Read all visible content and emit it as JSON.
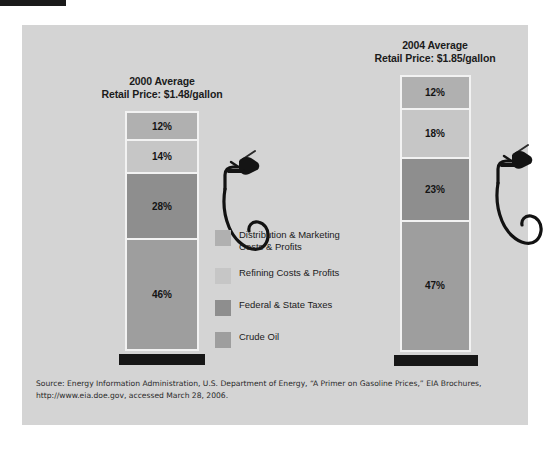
{
  "figure": {
    "source_line1": "Source: Energy Information Administration, U.S. Department of Energy, “A Primer on Gasoline Prices,” EIA Brochures,",
    "source_line2": "http://www.eia.doe.gov, accessed March 28, 2006."
  },
  "legend": {
    "items": [
      {
        "label": "Distribution & Marketing\nCosts & Profits",
        "color": "#b0b0b0"
      },
      {
        "label": "Refining Costs & Profits",
        "color": "#c6c6c6"
      },
      {
        "label": "Federal & State Taxes",
        "color": "#8e8e8e"
      },
      {
        "label": "Crude Oil",
        "color": "#9e9e9e"
      }
    ]
  },
  "charts": [
    {
      "id": "chart-2000",
      "title_line1": "2000 Average",
      "title_line2": "Retail Price: $1.48/gallon",
      "segments": [
        {
          "label": "12%",
          "value": 12,
          "name": "Distribution & Marketing Costs & Profits",
          "color": "#b0b0b0"
        },
        {
          "label": "14%",
          "value": 14,
          "name": "Refining Costs & Profits",
          "color": "#c6c6c6"
        },
        {
          "label": "28%",
          "value": 28,
          "name": "Federal & State Taxes",
          "color": "#8e8e8e"
        },
        {
          "label": "46%",
          "value": 46,
          "name": "Crude Oil",
          "color": "#9e9e9e"
        }
      ]
    },
    {
      "id": "chart-2004",
      "title_line1": "2004 Average",
      "title_line2": "Retail Price: $1.85/gallon",
      "segments": [
        {
          "label": "12%",
          "value": 12,
          "name": "Distribution & Marketing Costs & Profits",
          "color": "#b0b0b0"
        },
        {
          "label": "18%",
          "value": 18,
          "name": "Refining Costs & Profits",
          "color": "#c6c6c6"
        },
        {
          "label": "23%",
          "value": 23,
          "name": "Federal & State Taxes",
          "color": "#8e8e8e"
        },
        {
          "label": "47%",
          "value": 47,
          "name": "Crude Oil",
          "color": "#9e9e9e"
        }
      ]
    }
  ],
  "chart_data": {
    "type": "bar",
    "subtype": "stacked-100-percent",
    "categories": [
      "2000 Average\nRetail Price: $1.48/gallon",
      "2004 Average\nRetail Price: $1.85/gallon"
    ],
    "series": [
      {
        "name": "Distribution & Marketing Costs & Profits",
        "values": [
          12,
          12
        ],
        "color": "#b0b0b0"
      },
      {
        "name": "Refining Costs & Profits",
        "values": [
          14,
          18
        ],
        "color": "#c6c6c6"
      },
      {
        "name": "Federal & State Taxes",
        "values": [
          28,
          23
        ],
        "color": "#8e8e8e"
      },
      {
        "name": "Crude Oil",
        "values": [
          46,
          47
        ],
        "color": "#9e9e9e"
      }
    ],
    "stack_order_top_to_bottom": [
      "Distribution & Marketing Costs & Profits",
      "Refining Costs & Profits",
      "Federal & State Taxes",
      "Crude Oil"
    ],
    "retail_price_per_gallon": {
      "2000": 1.48,
      "2004": 1.85
    },
    "unit": "percent",
    "ylim": [
      0,
      100
    ],
    "xlabel": "",
    "ylabel": "",
    "grid": false,
    "legend_position": "center",
    "data_labels": true,
    "annotations": [
      "Gas pump nozzle illustration beside each bar",
      "Black pedestal base beneath each bar"
    ]
  }
}
